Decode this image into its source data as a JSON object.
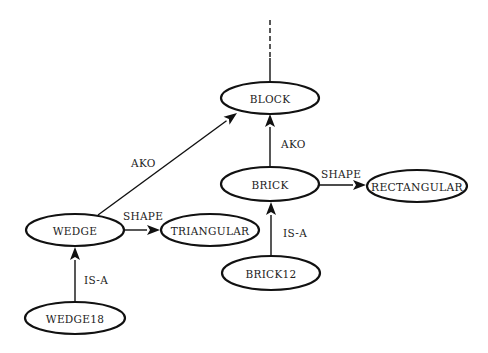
{
  "diagram": {
    "type": "semantic-network",
    "nodes": [
      {
        "id": "block",
        "label": "BLOCK",
        "cx": 270,
        "cy": 98,
        "rx": 49,
        "ry": 16
      },
      {
        "id": "brick",
        "label": "BRICK",
        "cx": 270,
        "cy": 184,
        "rx": 49,
        "ry": 17
      },
      {
        "id": "rectangular",
        "label": "RECTANGULAR",
        "cx": 417,
        "cy": 186,
        "rx": 50,
        "ry": 16
      },
      {
        "id": "wedge",
        "label": "WEDGE",
        "cx": 75,
        "cy": 230,
        "rx": 49,
        "ry": 16
      },
      {
        "id": "triangular",
        "label": "TRIANGULAR",
        "cx": 210,
        "cy": 230,
        "rx": 49,
        "ry": 16
      },
      {
        "id": "brick12",
        "label": "BRICK12",
        "cx": 271,
        "cy": 273,
        "rx": 49,
        "ry": 17
      },
      {
        "id": "wedge18",
        "label": "WEDGE18",
        "cx": 75,
        "cy": 318,
        "rx": 50,
        "ry": 16
      }
    ],
    "edges": [
      {
        "from": "brick",
        "to": "block",
        "label": "AKO",
        "x1": 270,
        "y1": 167,
        "x2": 270,
        "y2": 114,
        "lx": 281,
        "ly": 144
      },
      {
        "from": "wedge",
        "to": "block",
        "label": "AKO",
        "x1": 98,
        "y1": 215,
        "x2": 237,
        "y2": 113,
        "lx": 131,
        "ly": 163
      },
      {
        "from": "brick",
        "to": "rectangular",
        "label": "SHAPE",
        "x1": 319,
        "y1": 185,
        "x2": 366,
        "y2": 185,
        "lx": 321,
        "ly": 174
      },
      {
        "from": "wedge",
        "to": "triangular",
        "label": "SHAPE",
        "x1": 124,
        "y1": 230,
        "x2": 160,
        "y2": 230,
        "lx": 123,
        "ly": 216
      },
      {
        "from": "brick12",
        "to": "brick",
        "label": "IS-A",
        "x1": 271,
        "y1": 256,
        "x2": 271,
        "y2": 202,
        "lx": 283,
        "ly": 233
      },
      {
        "from": "wedge18",
        "to": "wedge",
        "label": "IS-A",
        "x1": 75,
        "y1": 302,
        "x2": 75,
        "y2": 247,
        "lx": 84,
        "ly": 280
      }
    ],
    "continuation": {
      "from": "block",
      "direction": "up",
      "solid_from_y": 82,
      "solid_to_y": 58,
      "dashed_to_y": 20,
      "x": 270
    }
  }
}
